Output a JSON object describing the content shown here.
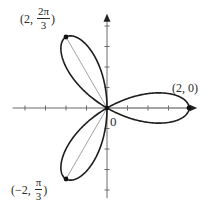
{
  "figure": {
    "title": "",
    "curve_description": "Three-leaved rose r = 2cos(3θ)",
    "colors": {
      "curve": "#1e1e1e",
      "axis": "#6a6a6a",
      "chord": "#8a8a8a",
      "text": "#2a2a2a"
    },
    "origin_label": "0",
    "labels": {
      "point_top": {
        "open": "(2,",
        "num": "2π",
        "den": "3",
        "close": ")"
      },
      "point_right": {
        "text": "(2, 0)"
      },
      "point_bottom": {
        "open": "(−2,",
        "num": "π",
        "den": "3",
        "close": ")"
      }
    },
    "axes": {
      "x_ticks_per_unit": 2,
      "y_ticks_per_unit": 2,
      "arrows": [
        "positive-x",
        "positive-y"
      ]
    }
  },
  "chart_data": {
    "type": "line",
    "title": "",
    "xlabel": "",
    "ylabel": "",
    "equation": "r = 2cos(3θ)",
    "coordinate_system": "polar",
    "xlim": [
      -2.3,
      2.2
    ],
    "ylim": [
      -2.2,
      2.3
    ],
    "grid": false,
    "tick_spacing": 0.5,
    "series": [
      {
        "name": "rose",
        "theta_range": [
          0,
          3.14159
        ],
        "petals": 3
      }
    ],
    "annotated_points": [
      {
        "label": "(2, 0)",
        "r": 2,
        "theta": "0",
        "x": 2.0,
        "y": 0.0
      },
      {
        "label": "(2, 2π/3)",
        "r": 2,
        "theta": "2π/3",
        "x": -1.0,
        "y": 1.732
      },
      {
        "label": "(−2, π/3)",
        "r": -2,
        "theta": "π/3",
        "x": -1.0,
        "y": -1.732
      }
    ],
    "annotations": [
      "0"
    ]
  }
}
